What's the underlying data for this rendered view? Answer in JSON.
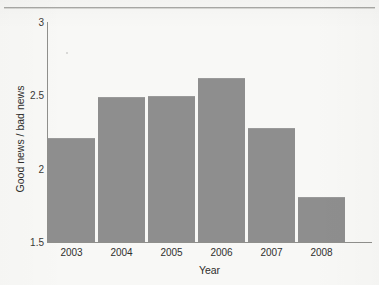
{
  "figure": {
    "caption_cropped": "",
    "background_color": "#f8f8f6",
    "bar_color": "#8e8e8e",
    "axis_color": "#8f8f8c"
  },
  "chart_data": {
    "type": "bar",
    "title": "",
    "xlabel": "Year",
    "ylabel": "Good news / bad news",
    "categories": [
      "2003",
      "2004",
      "2005",
      "2006",
      "2007",
      "2008"
    ],
    "values": [
      2.2,
      2.48,
      2.49,
      2.61,
      2.27,
      1.8
    ],
    "ylim": [
      1.5,
      3
    ],
    "yticks": [
      "1.5",
      "2",
      "2.5",
      "3"
    ],
    "ytick_values": [
      1.5,
      2,
      2.5,
      3
    ],
    "grid": false,
    "legend": null,
    "series": [
      {
        "name": "Good news / bad news",
        "values": [
          2.2,
          2.48,
          2.49,
          2.61,
          2.27,
          1.8
        ]
      }
    ]
  }
}
